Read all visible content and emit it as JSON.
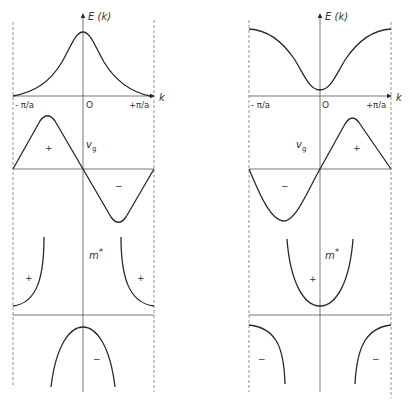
{
  "figure": {
    "colors": {
      "line": "#2a2a2a",
      "axis": "#555555",
      "dashed": "#777777",
      "background": "#ffffff"
    }
  },
  "left_panel": {
    "energy_axis_label": "E (k)",
    "k_axis_label": "k",
    "tick_left": "- π/a",
    "tick_origin": "O",
    "tick_right": "+π/a",
    "vg_label": "v",
    "vg_subscript": "g",
    "vg_sign_left": "+",
    "vg_sign_right": "−",
    "mstar_label": "m",
    "mstar_superscript": "*",
    "mstar_sign_left": "+",
    "mstar_sign_right": "+",
    "mstar_sign_bottom": "−"
  },
  "right_panel": {
    "energy_axis_label": "E (k)",
    "k_axis_label": "k",
    "tick_left": "- π/a",
    "tick_origin": "O",
    "tick_right": "+π/a",
    "vg_label": "v",
    "vg_subscript": "g",
    "vg_sign_left": "−",
    "vg_sign_right": "+",
    "mstar_label": "m",
    "mstar_superscript": "*",
    "mstar_sign_center": "+",
    "mstar_sign_bottom_left": "−",
    "mstar_sign_bottom_right": "−"
  }
}
